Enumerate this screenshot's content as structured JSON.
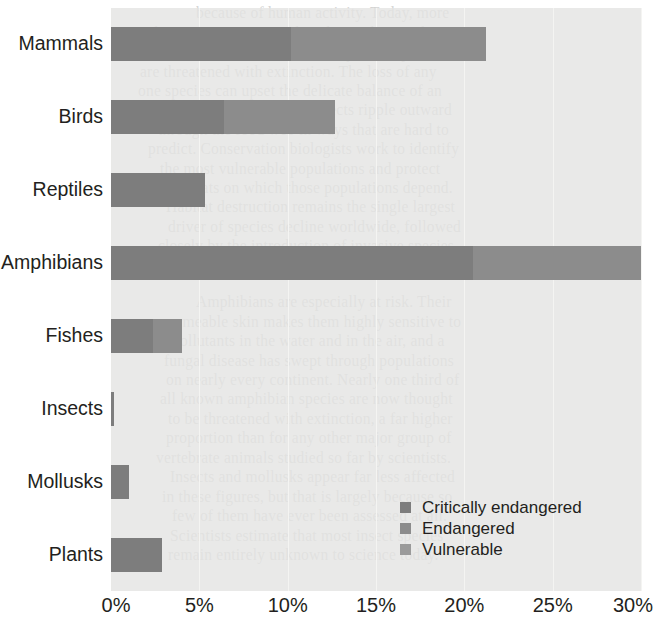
{
  "chart_data": {
    "type": "bar",
    "orientation": "horizontal",
    "stacked": true,
    "title": "",
    "subtitle": "",
    "xlabel": "",
    "ylabel": "",
    "xlim": [
      0,
      30
    ],
    "xunit": "%",
    "grid": true,
    "grid_axis": "x",
    "legend_position": "bottom-right",
    "categories": [
      "Mammals",
      "Birds",
      "Reptiles",
      "Amphibians",
      "Fishes",
      "Insects",
      "Mollusks",
      "Plants"
    ],
    "xticks": [
      0,
      5,
      10,
      15,
      20,
      25,
      30
    ],
    "xticklabels": [
      "0%",
      "5%",
      "10%",
      "15%",
      "20%",
      "25%",
      "30%"
    ],
    "series": [
      {
        "name": "Critically endangered",
        "color": "#7d7d7d",
        "values": [
          10.2,
          6.4,
          5.3,
          20.5,
          2.4,
          0.15,
          1.0,
          2.9
        ]
      },
      {
        "name": "Endangered",
        "color": "#8c8c8c",
        "values": [
          11.0,
          6.3,
          0.0,
          9.5,
          1.6,
          0.0,
          0.0,
          0.0
        ]
      },
      {
        "name": "Vulnerable",
        "color": "#9a9a9a",
        "values": [
          0.0,
          0.0,
          0.0,
          0.0,
          0.0,
          0.0,
          0.0,
          0.0
        ]
      }
    ],
    "totals": [
      21.2,
      12.7,
      5.3,
      30.0,
      4.0,
      0.15,
      1.0,
      2.9
    ],
    "plot_background": "#e4e4e2",
    "gridline_color": "#f4f4f2",
    "text_color": "#231f20"
  },
  "legend": {
    "entries": [
      {
        "label": "Critically endangered",
        "color": "#7d7d7d"
      },
      {
        "label": "Endangered",
        "color": "#8c8c8c"
      },
      {
        "label": "Vulnerable",
        "color": "#9a9a9a"
      }
    ]
  },
  "page_bleed": {
    "lines": [
      {
        "text": "because of human activity. Today, more",
        "x": 196,
        "y": 4
      },
      {
        "text": "than 2,000 species are listed as endangered",
        "x": 150,
        "y": 24
      },
      {
        "text": "and the United States alone. Many more species",
        "x": 134,
        "y": 44
      },
      {
        "text": "are threatened with extinction. The loss of any",
        "x": 140,
        "y": 63
      },
      {
        "text": "one species can upset the delicate balance of an",
        "x": 138,
        "y": 82
      },
      {
        "text": "entire ecosystem, and the effects ripple outward",
        "x": 146,
        "y": 101
      },
      {
        "text": "through the food web in ways that are hard to",
        "x": 158,
        "y": 121
      },
      {
        "text": "predict. Conservation biologists work to identify",
        "x": 148,
        "y": 140
      },
      {
        "text": "the most vulnerable populations and protect",
        "x": 160,
        "y": 160
      },
      {
        "text": "the habitats on which those populations depend.",
        "x": 146,
        "y": 179
      },
      {
        "text": "Habitat destruction remains the single largest",
        "x": 166,
        "y": 198
      },
      {
        "text": "driver of species decline worldwide, followed",
        "x": 168,
        "y": 218
      },
      {
        "text": "closely by the introduction of invasive species",
        "x": 158,
        "y": 237
      },
      {
        "text": "and by the changing global climate.",
        "x": 184,
        "y": 256
      },
      {
        "text": "Amphibians are especially at risk. Their",
        "x": 196,
        "y": 293
      },
      {
        "text": "permeable skin makes them highly sensitive to",
        "x": 162,
        "y": 313
      },
      {
        "text": "pollutants in the water and in the air, and a",
        "x": 172,
        "y": 332
      },
      {
        "text": "fungal disease has swept through populations",
        "x": 164,
        "y": 352
      },
      {
        "text": "on nearly every continent. Nearly one third of",
        "x": 166,
        "y": 371
      },
      {
        "text": "all known amphibian species are now thought",
        "x": 160,
        "y": 390
      },
      {
        "text": "to be threatened with extinction, a far higher",
        "x": 168,
        "y": 410
      },
      {
        "text": "proportion than for any other major group of",
        "x": 166,
        "y": 429
      },
      {
        "text": "vertebrate animals studied so far by scientists.",
        "x": 156,
        "y": 449
      },
      {
        "text": "Insects and mollusks appear far less affected",
        "x": 170,
        "y": 468
      },
      {
        "text": "in these figures, but that is largely because so",
        "x": 162,
        "y": 488
      },
      {
        "text": "few of them have ever been assessed at all.",
        "x": 172,
        "y": 507
      },
      {
        "text": "Scientists estimate that most insect species",
        "x": 170,
        "y": 527
      },
      {
        "text": "remain entirely unknown to science today.",
        "x": 168,
        "y": 546
      }
    ]
  }
}
